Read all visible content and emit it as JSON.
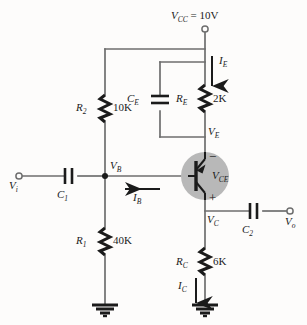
{
  "diagram": {
    "type": "schematic",
    "title_label": "V_CC = 10V",
    "circuit": "PNP common-emitter amplifier with voltage-divider bias",
    "background_color": "#fdfcfb",
    "wire_color": "#6e6e6e",
    "ink_color": "#1b1b1b",
    "transistor_body_color": "#b5b5b5"
  },
  "supply": {
    "name": "V",
    "sub": "CC",
    "equals": " = 10V"
  },
  "nodes": {
    "vb": {
      "name": "V",
      "sub": "B"
    },
    "ve": {
      "name": "V",
      "sub": "E"
    },
    "vc": {
      "name": "V",
      "sub": "C"
    },
    "vi": {
      "name": "V",
      "sub": "i"
    },
    "vo": {
      "name": "V",
      "sub": "o"
    },
    "vce": {
      "name": "V",
      "sub": "CE"
    },
    "vce_minus": "−",
    "vce_plus": "+"
  },
  "resistors": [
    {
      "id": "r2",
      "name": "R",
      "sub": "2",
      "value": "10K"
    },
    {
      "id": "r1",
      "name": "R",
      "sub": "1",
      "value": "40K"
    },
    {
      "id": "re",
      "name": "R",
      "sub": "E",
      "value": "2K"
    },
    {
      "id": "rc",
      "name": "R",
      "sub": "C",
      "value": "6K"
    }
  ],
  "capacitors": [
    {
      "id": "c1",
      "name": "C",
      "sub": "1"
    },
    {
      "id": "c2",
      "name": "C",
      "sub": "2"
    },
    {
      "id": "ce",
      "name": "C",
      "sub": "E"
    }
  ],
  "currents": [
    {
      "id": "ie",
      "name": "I",
      "sub": "E",
      "direction": "down"
    },
    {
      "id": "ib",
      "name": "I",
      "sub": "B",
      "direction": "left"
    },
    {
      "id": "ic",
      "name": "I",
      "sub": "C",
      "direction": "down"
    }
  ],
  "terminals": [
    {
      "id": "vcc-terminal",
      "label": "V_CC"
    },
    {
      "id": "vi-terminal",
      "label": "V_i"
    },
    {
      "id": "vo-terminal",
      "label": "V_o"
    }
  ],
  "grounds": [
    {
      "id": "ground-left"
    },
    {
      "id": "ground-right"
    }
  ]
}
